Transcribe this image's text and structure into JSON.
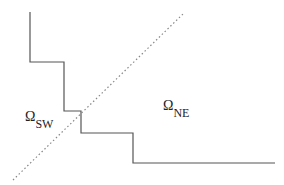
{
  "diagram": {
    "labels": {
      "sw": {
        "symbol": "Ω",
        "subscript": "SW"
      },
      "ne": {
        "symbol": "Ω",
        "subscript": "NE"
      }
    },
    "staircase": {
      "color": "#555555",
      "points": [
        [
          30,
          12
        ],
        [
          30,
          62
        ],
        [
          64,
          62
        ],
        [
          64,
          111
        ],
        [
          81,
          111
        ],
        [
          81,
          133
        ],
        [
          133,
          133
        ],
        [
          133,
          163
        ],
        [
          275,
          163
        ]
      ]
    },
    "diagonal": {
      "style": "dotted",
      "color": "#888888",
      "from": [
        13,
        180
      ],
      "to": [
        184,
        13
      ]
    }
  }
}
